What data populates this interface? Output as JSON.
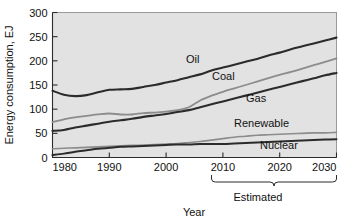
{
  "chart_data": {
    "type": "line",
    "title": "",
    "xlabel": "Year",
    "ylabel": "Energy consumption, EJ",
    "xlim": [
      1980,
      2030
    ],
    "ylim": [
      0,
      300
    ],
    "grid": false,
    "legend_position": "inline-labels",
    "x_ticks": [
      "1980",
      "1990",
      "2000",
      "2010",
      "2020",
      "2030"
    ],
    "x_tick_values": [
      1980,
      1990,
      2000,
      2010,
      2020,
      2030
    ],
    "y_ticks": [
      "0",
      "50",
      "100",
      "150",
      "200",
      "250",
      "300"
    ],
    "y_tick_values": [
      0,
      50,
      100,
      150,
      200,
      250,
      300
    ],
    "x": [
      1980,
      1982,
      1984,
      1986,
      1988,
      1990,
      1992,
      1994,
      1996,
      1998,
      2000,
      2002,
      2004,
      2006,
      2008,
      2010,
      2012,
      2014,
      2016,
      2018,
      2020,
      2022,
      2024,
      2026,
      2028,
      2030
    ],
    "series": [
      {
        "name": "Oil",
        "color": "#2b2b2b",
        "width": 2.1,
        "values": [
          138,
          130,
          127,
          129,
          135,
          140,
          141,
          142,
          146,
          150,
          155,
          160,
          166,
          172,
          180,
          186,
          192,
          198,
          204,
          211,
          217,
          224,
          230,
          236,
          242,
          248
        ]
      },
      {
        "name": "Coal",
        "color": "#8c8c8c",
        "width": 1.8,
        "values": [
          73,
          79,
          83,
          86,
          89,
          91,
          89,
          89,
          92,
          93,
          95,
          98,
          104,
          118,
          128,
          136,
          143,
          150,
          157,
          164,
          171,
          177,
          184,
          191,
          198,
          205
        ]
      },
      {
        "name": "Gas",
        "color": "#2b2b2b",
        "width": 2.1,
        "values": [
          55,
          57,
          62,
          66,
          70,
          74,
          77,
          80,
          84,
          87,
          90,
          94,
          98,
          104,
          110,
          116,
          122,
          128,
          134,
          140,
          146,
          152,
          158,
          164,
          170,
          175
        ]
      },
      {
        "name": "Renewable",
        "color": "#8c8c8c",
        "width": 1.6,
        "values": [
          18,
          19,
          20,
          21,
          22,
          23,
          24,
          25,
          26,
          27,
          28,
          29,
          31,
          33,
          36,
          39,
          42,
          44,
          46,
          47,
          48,
          49,
          50,
          51,
          51,
          52
        ]
      },
      {
        "name": "Nuclear",
        "color": "#2b2b2b",
        "width": 2.0,
        "values": [
          5,
          8,
          12,
          15,
          18,
          20,
          22,
          23,
          24,
          25,
          26,
          27,
          27,
          28,
          28,
          28,
          29,
          30,
          31,
          32,
          33,
          34,
          35,
          36,
          37,
          38
        ]
      }
    ],
    "series_labels": [
      {
        "text": "Oil",
        "x": 186,
        "y": 63
      },
      {
        "text": "Coal",
        "x": 212,
        "y": 80
      },
      {
        "text": "Gas",
        "x": 246,
        "y": 102
      },
      {
        "text": "Renewable",
        "x": 234,
        "y": 127
      },
      {
        "text": "Nuclear",
        "x": 260,
        "y": 149
      }
    ],
    "annotations": [
      {
        "name": "estimated-brace",
        "text": "Estimated",
        "x_start": 2008,
        "x_end": 2030,
        "label_x": 258,
        "label_y": 201
      }
    ]
  }
}
